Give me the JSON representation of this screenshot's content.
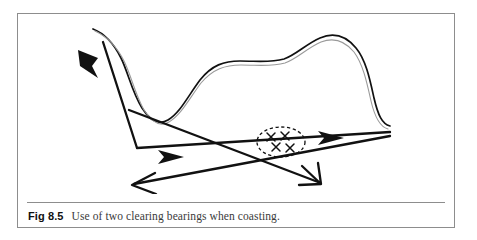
{
  "figure": {
    "caption_label": "Fig 8.5",
    "caption_text": "Use of two clearing bearings when coasting.",
    "frame_color": "#8d8d8d",
    "ink_color": "#111111",
    "background_color": "#ffffff"
  },
  "diagram": {
    "title": "Use of two clearing bearings when coasting.",
    "coastline_label": "coastline",
    "hazard_label": "rocks-hazard-area",
    "hazard_marks": [
      "x",
      "x",
      "x",
      "x"
    ],
    "track_label": "ship-track",
    "bearing_one_label": "clearing-bearing-1",
    "bearing_two_label": "clearing-bearing-2",
    "arrow_count": 4
  }
}
